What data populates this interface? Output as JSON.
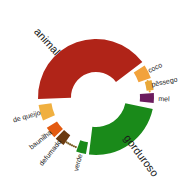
{
  "chart_data": {
    "type": "pie",
    "title": "",
    "subtitle": "",
    "xlabel": "",
    "ylabel": "",
    "legend_position": "none",
    "grid": false,
    "shape": "donut",
    "center": [
      96,
      97
    ],
    "inner_radius": 25,
    "outer_radius": 58,
    "angle_units": "degrees, 0 = up (12 o'clock), clockwise positive",
    "categories": [
      "animal",
      "coco",
      "pêssego",
      "mel",
      "gorduroso",
      "verde",
      "defumado",
      "baunilha",
      "de queijo"
    ],
    "values": [
      145,
      14,
      10,
      12,
      85,
      10,
      10,
      12,
      16
    ],
    "colors": [
      "#b02418",
      "#f2a23c",
      "#e8a83a",
      "#6b1b5e",
      "#1a8a1a",
      "#1a8a1a",
      "#6b3a10",
      "#e35a10",
      "#f0b040"
    ],
    "series": [
      {
        "name": "intensidade",
        "values": [
          145,
          14,
          10,
          12,
          85,
          10,
          10,
          12,
          16
        ]
      }
    ],
    "slices": [
      {
        "label": "animal",
        "color": "#b02418",
        "start_angle": 268,
        "end_angle": 53,
        "inner_radius": 25,
        "outer_radius": 58,
        "style": "solid",
        "label_radius": 74,
        "label_angle": 318,
        "label_size": 11
      },
      {
        "label": "coco",
        "color": "#f2a23c",
        "start_angle": 57,
        "end_angle": 71,
        "inner_radius": 45,
        "outer_radius": 58,
        "style": "solid",
        "label_radius": 66,
        "label_angle": 64,
        "label_size": 7
      },
      {
        "label": "pêssego",
        "color": "#e8a83a",
        "start_angle": 73,
        "end_angle": 83,
        "inner_radius": 51,
        "outer_radius": 58,
        "style": "dotted",
        "label_radius": 70,
        "label_angle": 78,
        "label_size": 7
      },
      {
        "label": "mel",
        "color": "#6b1b5e",
        "start_angle": 86,
        "end_angle": 96,
        "inner_radius": 44,
        "outer_radius": 58,
        "style": "solid",
        "label_radius": 68,
        "label_angle": 92,
        "label_size": 7
      },
      {
        "label": "gorduroso",
        "color": "#1a8a1a",
        "start_angle": 102,
        "end_angle": 187,
        "inner_radius": 30,
        "outer_radius": 58,
        "style": "solid",
        "label_radius": 74,
        "label_angle": 143,
        "label_size": 11
      },
      {
        "label": "verde",
        "color": "#1a8a1a",
        "start_angle": 190,
        "end_angle": 200,
        "inner_radius": 46,
        "outer_radius": 58,
        "style": "solid",
        "label_radius": 68,
        "label_angle": 195,
        "label_size": 7
      },
      {
        "label": "defumado",
        "color": "#6b3a10",
        "start_angle": 214,
        "end_angle": 224,
        "inner_radius": 46,
        "outer_radius": 58,
        "style": "solid",
        "label_radius": 72,
        "label_angle": 219,
        "label_size": 7
      },
      {
        "label": "baunilha",
        "color": "#e35a10",
        "start_angle": 226,
        "end_angle": 238,
        "inner_radius": 46,
        "outer_radius": 58,
        "style": "solid",
        "label_radius": 70,
        "label_angle": 232,
        "label_size": 7
      },
      {
        "label": "de queijo",
        "color": "#f0b040",
        "start_angle": 246,
        "end_angle": 262,
        "inner_radius": 45,
        "outer_radius": 58,
        "style": "solid",
        "label_radius": 72,
        "label_angle": 254,
        "label_size": 7
      }
    ],
    "dotted_trails": [
      {
        "label": "pêssego",
        "color": "#e8a83a",
        "from_angle": 73,
        "to_angle": 84,
        "radius": 54,
        "dots": 5
      },
      {
        "label": "verde-trail",
        "color": "#7a5a20",
        "from_angle": 202,
        "to_angle": 213,
        "radius": 54,
        "dots": 6
      }
    ],
    "background": "#ffffff",
    "text_color": "#1a1a1a"
  },
  "chart": {
    "name": "flavor-wheel",
    "background": "#ffffff"
  }
}
